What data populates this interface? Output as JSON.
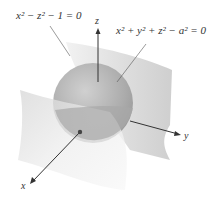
{
  "diagram": {
    "equations": {
      "cylinder": "x² − z² − 1 = 0",
      "sphere": "x² + y² + z² − a² = 0"
    },
    "axes": {
      "x": "x",
      "y": "y",
      "z": "z"
    },
    "colors": {
      "surface_light": "#e6e6e6",
      "surface_dark": "#c4c4c4",
      "sphere": "#a9a9a9",
      "axis": "#333333"
    }
  }
}
